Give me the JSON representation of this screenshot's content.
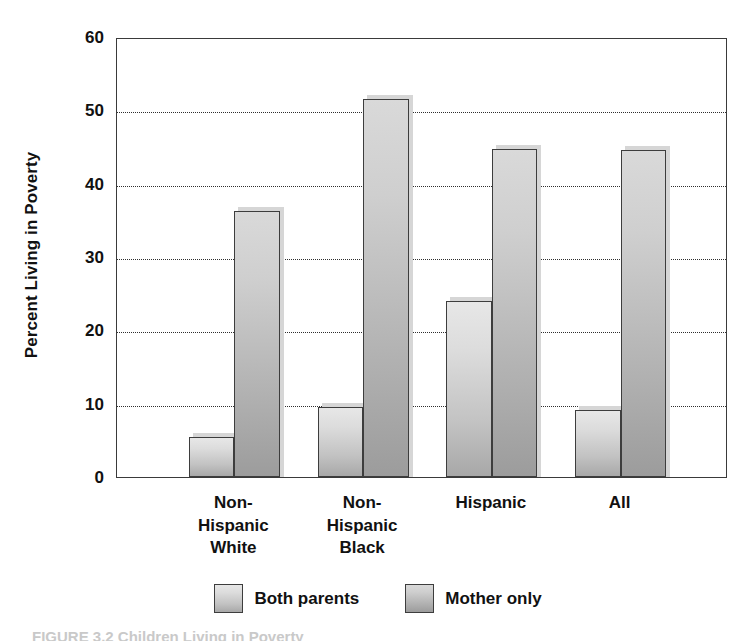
{
  "chart_data": {
    "type": "bar",
    "title": "",
    "xlabel": "",
    "ylabel": "Percent Living in Poverty",
    "ylim": [
      0,
      60
    ],
    "yticks": [
      0,
      10,
      20,
      30,
      40,
      50,
      60
    ],
    "ytick_labels": [
      "0",
      "10",
      "20",
      "30",
      "40",
      "50",
      "60"
    ],
    "grid": true,
    "legend_position": "bottom-center",
    "categories": [
      "Non-\nHispanic\nWhite",
      "Non-\nHispanic\nBlack",
      "Hispanic",
      "All"
    ],
    "category_labels_flat": [
      "Non-Hispanic White",
      "Non-Hispanic Black",
      "Hispanic",
      "All"
    ],
    "series": [
      {
        "name": "Both parents",
        "values": [
          5.5,
          9.5,
          24.0,
          9.2
        ]
      },
      {
        "name": "Mother only",
        "values": [
          36.3,
          51.6,
          44.7,
          44.6
        ]
      }
    ]
  },
  "legend": {
    "items": [
      {
        "label": "Both parents",
        "swatch": "legend-swatch-both-parents"
      },
      {
        "label": "Mother only",
        "swatch": "legend-swatch-mother-only"
      }
    ]
  },
  "caption": {
    "text": "FIGURE 3.2  Children Living in Poverty"
  },
  "colors": {
    "bar_series_0_top": "#e7e7e7",
    "bar_series_0_bottom": "#a8a8a8",
    "bar_series_1_top": "#d9d9d9",
    "bar_series_1_bottom": "#9c9c9c",
    "bar_outline": "#3d3d3d",
    "gridline": "#2f2f2f",
    "axis": "#3a3a3a",
    "background": "#ffffff",
    "text": "#111111"
  }
}
